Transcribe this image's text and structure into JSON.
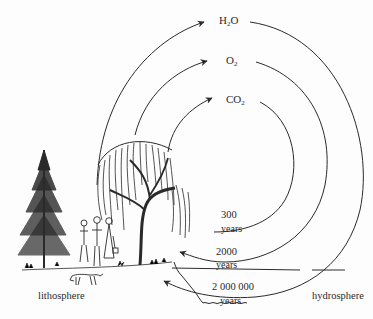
{
  "diagram": {
    "title": "",
    "cycles": [
      {
        "id": "h2o",
        "molecule": {
          "base": "H",
          "sub": "2",
          "tail": "O"
        },
        "duration": "2 000 000",
        "unit": "years"
      },
      {
        "id": "o2",
        "molecule": {
          "base": "O",
          "sub": "2",
          "tail": ""
        },
        "duration": "2000",
        "unit": "years"
      },
      {
        "id": "co2",
        "molecule": {
          "base": "CO",
          "sub": "2",
          "tail": ""
        },
        "duration": "300",
        "unit": "years"
      }
    ],
    "regions": {
      "left": "lithosphere",
      "right": "hydrosphere"
    },
    "illustrations": [
      "spruce-tree",
      "willow-tree",
      "family-of-people",
      "dog",
      "shoreline"
    ],
    "colors": {
      "ink": "#2a2a2a",
      "background": "#fdfdfd"
    }
  }
}
